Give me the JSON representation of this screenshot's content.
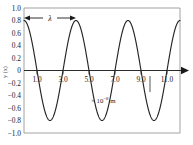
{
  "chart_data": {
    "type": "line",
    "title": "",
    "subtitle": "",
    "xlabel": "× 10⁻⁸ m",
    "ylabel": "y (x)",
    "xlim": [
      0,
      12
    ],
    "ylim": [
      -1.0,
      1.0
    ],
    "grid": false,
    "legend": "none",
    "x_ticks": [
      "1.0",
      "3.0",
      "5.0",
      "7.0",
      "9.0",
      "11.0"
    ],
    "x_tick_values": [
      1.0,
      3.0,
      5.0,
      7.0,
      9.0,
      11.0
    ],
    "y_ticks": [
      "1.0",
      "0.8",
      "0.6",
      "0.4",
      "0.2",
      "0",
      "−0.2",
      "−0.4",
      "−0.6",
      "−0.8",
      "−1.0"
    ],
    "y_tick_values": [
      1.0,
      0.8,
      0.6,
      0.4,
      0.2,
      0,
      -0.2,
      -0.4,
      -0.6,
      -0.8,
      -1.0
    ],
    "series": [
      {
        "name": "wave",
        "form": "cosine",
        "amplitude": 0.8,
        "wavelength": 4.0,
        "phase": 0,
        "color": "#262626",
        "x": [
          0.0,
          0.25,
          0.5,
          0.75,
          1.0,
          1.25,
          1.5,
          1.75,
          2.0,
          2.25,
          2.5,
          2.75,
          3.0,
          3.25,
          3.5,
          3.75,
          4.0,
          4.25,
          4.5,
          4.75,
          5.0,
          5.25,
          5.5,
          5.75,
          6.0,
          6.25,
          6.5,
          6.75,
          7.0,
          7.25,
          7.5,
          7.75,
          8.0,
          8.25,
          8.5,
          8.75,
          9.0,
          9.25,
          9.5,
          9.75,
          10.0,
          10.25,
          10.5,
          10.75,
          11.0,
          11.25,
          11.5,
          11.75,
          12.0
        ],
        "y": [
          0.8,
          0.739,
          0.566,
          0.306,
          0.0,
          -0.306,
          -0.566,
          -0.739,
          -0.8,
          -0.739,
          -0.566,
          -0.306,
          0.0,
          0.306,
          0.566,
          0.739,
          0.8,
          0.739,
          0.566,
          0.306,
          0.0,
          -0.306,
          -0.566,
          -0.739,
          -0.8,
          -0.739,
          -0.566,
          -0.306,
          0.0,
          0.306,
          0.566,
          0.739,
          0.8,
          0.739,
          0.566,
          0.306,
          0.0,
          -0.306,
          -0.566,
          -0.739,
          -0.8,
          -0.739,
          -0.566,
          -0.306,
          0.0,
          0.306,
          0.566,
          0.739,
          0.8
        ]
      }
    ],
    "annotations": [
      {
        "name": "wavelength-marker",
        "label": "λ",
        "type": "double-arrow",
        "x_start": 0.0,
        "x_end": 4.0,
        "y": 0.84
      },
      {
        "name": "units-annotation",
        "label_prefix": "× 10",
        "label_exponent": "−8",
        "label_suffix": " m",
        "x": 6.1,
        "y": -0.52
      }
    ]
  },
  "axis": {
    "y_title": "y (x)",
    "x_arrow": true
  }
}
